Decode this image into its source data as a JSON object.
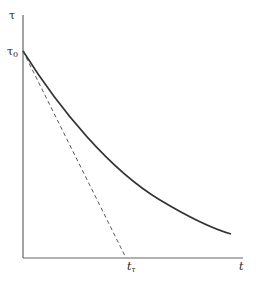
{
  "diagram": {
    "y_axis_label": "τ",
    "y_intercept_label": "τ",
    "y_intercept_subscript": "0",
    "x_axis_label": "t",
    "x_intercept_label": "t",
    "x_intercept_subscript": "τ",
    "curve": "exponential decay from τ0",
    "tangent": "dashed tangent at t=0 intersecting time axis at tτ",
    "colors": {
      "axis": "#555555",
      "curve": "#333333",
      "tangent": "#444444"
    }
  }
}
